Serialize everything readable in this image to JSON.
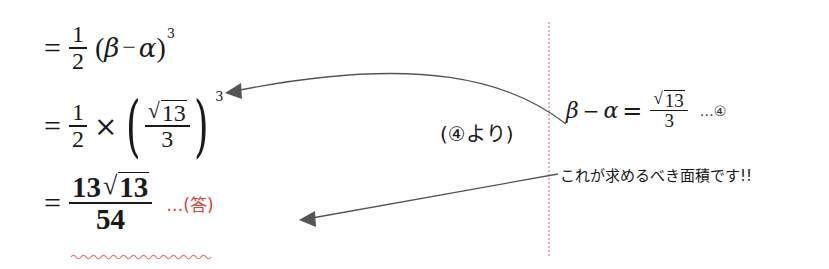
{
  "left_derivation": {
    "line1": {
      "equals": "=",
      "fraction": {
        "numerator": "1",
        "denominator": "2"
      },
      "open_paren": "(",
      "beta": "β",
      "minus": "−",
      "alpha": "α",
      "close_paren": ")",
      "exponent": "3"
    },
    "line2": {
      "equals": "=",
      "fraction": {
        "numerator": "1",
        "denominator": "2"
      },
      "times": "×",
      "open_paren": "(",
      "inner_fraction": {
        "radical": "√",
        "radicand": "13",
        "denominator": "3"
      },
      "close_paren": ")",
      "exponent": "3"
    },
    "line3": {
      "equals": "=",
      "fraction": {
        "coefficient": "13",
        "radical": "√",
        "radicand": "13",
        "denominator": "54"
      },
      "answer_marker": "…(答)"
    }
  },
  "middle_note": "(④より)",
  "right_panel": {
    "equation": {
      "lhs_beta": "β",
      "minus": "−",
      "lhs_alpha": "α",
      "equals": "=",
      "fraction": {
        "radical": "√",
        "radicand": "13",
        "denominator": "3"
      },
      "label": "…④"
    },
    "callout": "これが求めるべき面積です!!"
  },
  "colors": {
    "text": "#1a1a1a",
    "answer_red": "#e03c3c",
    "wavy_underline": "#e27070",
    "divider_pink": "#e6b3bf",
    "arrow_gray": "#555555"
  }
}
